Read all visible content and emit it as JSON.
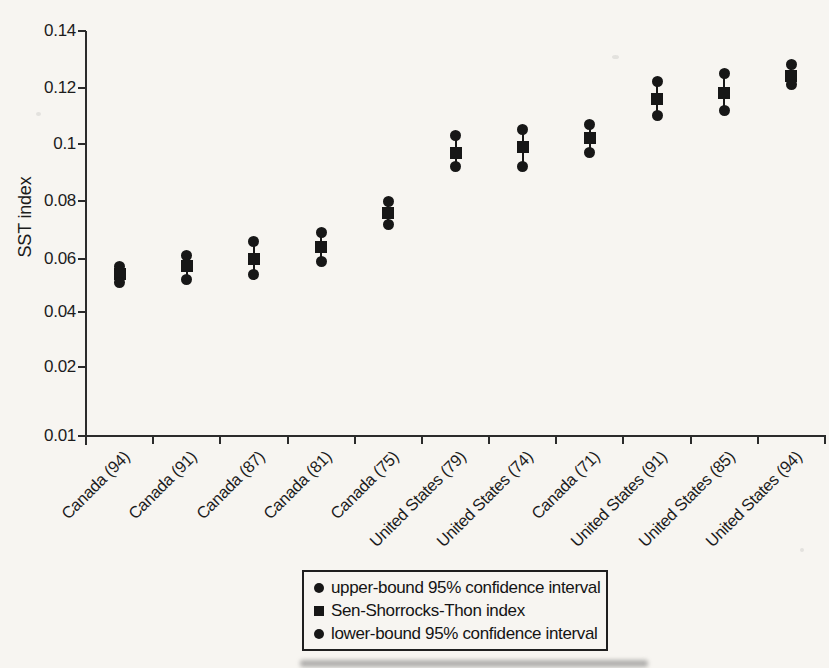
{
  "figure": {
    "background": "#f7f5f1",
    "ink": "#171717"
  },
  "chart_data": {
    "type": "scatter",
    "subtype": "point-estimates-with-confidence-intervals",
    "title": "",
    "xlabel": "",
    "ylabel": "SST index",
    "ylim": [
      0.01,
      0.14
    ],
    "grid": false,
    "y_ticks": [
      0.01,
      0.02,
      0.04,
      0.06,
      0.08,
      0.1,
      0.12,
      0.14
    ],
    "y_tick_labels": [
      "0.01",
      "0.02",
      "0.04",
      "0.06",
      "0.08",
      "0.1",
      "0.08",
      "0.14"
    ],
    "categories": [
      "Canada (94)",
      "Canada (91)",
      "Canada (87)",
      "Canada (81)",
      "Canada (75)",
      "United States (79)",
      "United States (74)",
      "Canada (71)",
      "United States (91)",
      "United States (85)",
      "United States (94)"
    ],
    "series": [
      {
        "name": "upper-bound 95% confidence interval",
        "marker": "circle",
        "values": [
          0.057,
          0.061,
          0.066,
          0.069,
          0.08,
          0.103,
          0.105,
          0.107,
          0.122,
          0.125,
          0.128
        ]
      },
      {
        "name": "Sen-Shorrocks-Thon index",
        "marker": "square",
        "values": [
          0.054,
          0.057,
          0.06,
          0.064,
          0.076,
          0.097,
          0.099,
          0.102,
          0.116,
          0.118,
          0.124
        ]
      },
      {
        "name": "lower-bound 95% confidence interval",
        "marker": "circle",
        "values": [
          0.051,
          0.052,
          0.054,
          0.059,
          0.072,
          0.092,
          0.092,
          0.097,
          0.11,
          0.112,
          0.121
        ]
      }
    ],
    "legend": {
      "position": "bottom-center",
      "border": true
    }
  }
}
